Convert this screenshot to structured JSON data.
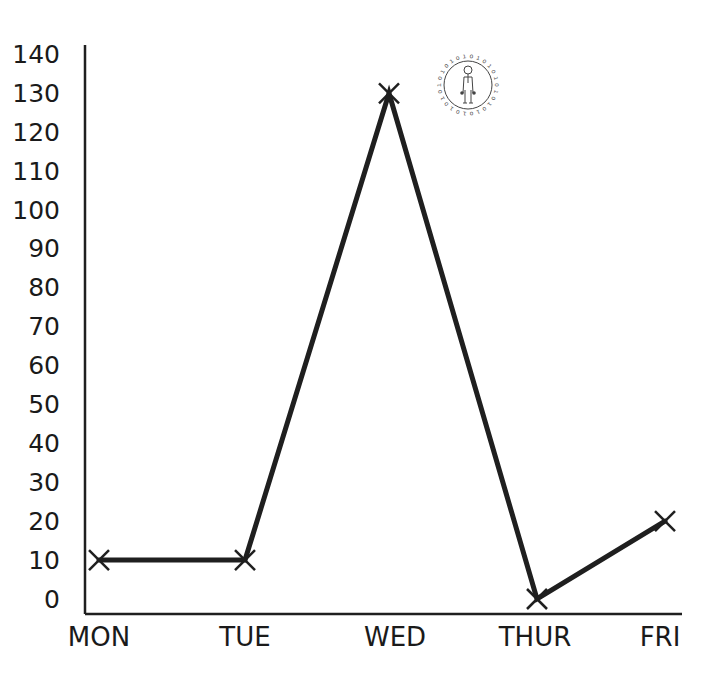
{
  "chart_data": {
    "type": "line",
    "title": "",
    "xlabel": "",
    "ylabel": "",
    "categories": [
      "MON",
      "TUE",
      "WED",
      "THUR",
      "FRI"
    ],
    "series": [
      {
        "name": "values",
        "values": [
          10,
          10,
          130,
          0,
          20
        ]
      }
    ],
    "yticks": [
      0,
      10,
      20,
      30,
      40,
      50,
      60,
      70,
      80,
      90,
      100,
      110,
      120,
      130,
      140
    ],
    "ylim": [
      0,
      140
    ],
    "grid": false,
    "legend": null,
    "marker": "x",
    "line_color": "#1f1f1f"
  },
  "logo": {
    "icon": "stick-figure-circle-logo"
  }
}
